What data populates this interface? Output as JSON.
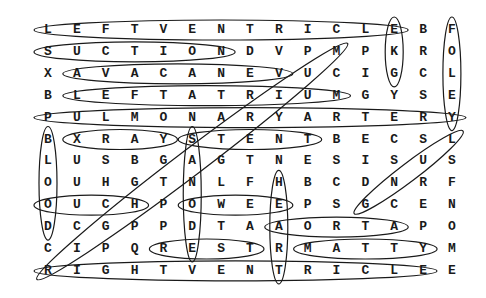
{
  "puzzle": {
    "type": "word-search",
    "rows": 12,
    "cols": 15,
    "grid": [
      [
        "L",
        "E",
        "F",
        "T",
        "V",
        "E",
        "N",
        "T",
        "R",
        "I",
        "C",
        "L",
        "E",
        "B",
        "F"
      ],
      [
        "S",
        "U",
        "C",
        "T",
        "I",
        "O",
        "N",
        "D",
        "V",
        "P",
        "M",
        "P",
        "K",
        "R",
        "O"
      ],
      [
        "X",
        "A",
        "V",
        "A",
        "C",
        "A",
        "N",
        "E",
        "V",
        "U",
        "C",
        "I",
        "G",
        "C",
        "L"
      ],
      [
        "B",
        "L",
        "E",
        "F",
        "T",
        "A",
        "T",
        "R",
        "I",
        "U",
        "M",
        "G",
        "Y",
        "S",
        "E"
      ],
      [
        "P",
        "U",
        "L",
        "M",
        "O",
        "N",
        "A",
        "R",
        "Y",
        "A",
        "R",
        "T",
        "E",
        "R",
        "Y"
      ],
      [
        "B",
        "X",
        "R",
        "A",
        "Y",
        "S",
        "T",
        "E",
        "N",
        "T",
        "B",
        "E",
        "C",
        "S",
        "L"
      ],
      [
        "L",
        "U",
        "S",
        "B",
        "G",
        "A",
        "G",
        "T",
        "N",
        "E",
        "S",
        "I",
        "S",
        "U",
        "S"
      ],
      [
        "O",
        "U",
        "H",
        "G",
        "T",
        "N",
        "L",
        "F",
        "H",
        "B",
        "C",
        "D",
        "N",
        "R",
        "F"
      ],
      [
        "O",
        "U",
        "C",
        "H",
        "P",
        "O",
        "W",
        "E",
        "E",
        "P",
        "S",
        "G",
        "C",
        "E",
        "N"
      ],
      [
        "D",
        "C",
        "G",
        "P",
        "P",
        "D",
        "T",
        "A",
        "A",
        "O",
        "R",
        "T",
        "A",
        "P",
        "O"
      ],
      [
        "C",
        "I",
        "P",
        "Q",
        "R",
        "E",
        "S",
        "T",
        "R",
        "M",
        "A",
        "T",
        "T",
        "Y",
        "M"
      ],
      [
        "R",
        "I",
        "G",
        "H",
        "T",
        "V",
        "E",
        "N",
        "T",
        "R",
        "I",
        "C",
        "L",
        "E",
        "E"
      ]
    ],
    "found_words": [
      {
        "word": "LEFT VENTRICLE",
        "dir": "h",
        "row": 1,
        "from": 1,
        "to": 13
      },
      {
        "word": "SUCTION",
        "dir": "h",
        "row": 2,
        "from": 1,
        "to": 7
      },
      {
        "word": "VENA CAVA",
        "dir": "h",
        "row": 3,
        "from": 2,
        "to": 9
      },
      {
        "word": "LEFT ATRIUM",
        "dir": "h",
        "row": 4,
        "from": 2,
        "to": 11
      },
      {
        "word": "PULMONARY ARTERY",
        "dir": "h",
        "row": 5,
        "from": 1,
        "to": 15
      },
      {
        "word": "XRAY",
        "dir": "h",
        "row": 6,
        "from": 2,
        "to": 5
      },
      {
        "word": "STENT",
        "dir": "h",
        "row": 6,
        "from": 6,
        "to": 10
      },
      {
        "word": "OUCH",
        "dir": "h",
        "row": 9,
        "from": 1,
        "to": 4
      },
      {
        "word": "OWEE",
        "dir": "h",
        "row": 9,
        "from": 6,
        "to": 9
      },
      {
        "word": "AORTA",
        "dir": "h",
        "row": 10,
        "from": 9,
        "to": 13
      },
      {
        "word": "REST",
        "dir": "h",
        "row": 11,
        "from": 5,
        "to": 8
      },
      {
        "word": "MATTY",
        "dir": "h",
        "row": 11,
        "from": 10,
        "to": 14
      },
      {
        "word": "RIGHT VENTRICLE",
        "dir": "h",
        "row": 12,
        "from": 1,
        "to": 14
      },
      {
        "word": "EKG",
        "dir": "v",
        "col": 13,
        "from": 1,
        "to": 3
      },
      {
        "word": "FOLEY",
        "dir": "v",
        "col": 15,
        "from": 1,
        "to": 5
      },
      {
        "word": "BLOOD",
        "dir": "v",
        "col": 1,
        "from": 6,
        "to": 10
      },
      {
        "word": "SA NODE",
        "dir": "v",
        "col": 6,
        "from": 6,
        "to": 11
      },
      {
        "word": "HEART",
        "dir": "v",
        "col": 9,
        "from": 8,
        "to": 12
      },
      {
        "word": "DIAGONAL-LONG",
        "dir": "d",
        "r1": 12,
        "c1": 1,
        "r2": 2,
        "c2": 11
      },
      {
        "word": "LUNG",
        "dir": "d",
        "r1": 9,
        "c1": 12,
        "r2": 6,
        "c2": 15
      }
    ]
  }
}
